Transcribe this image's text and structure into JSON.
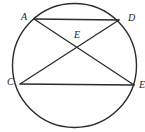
{
  "figure": {
    "kind": "circle-geometry-diagram",
    "canvas": {
      "width": 145,
      "height": 132,
      "background": "#ffffff"
    },
    "stroke_color": "#2b2b2b",
    "label_color": "#222222",
    "circle": {
      "cx": 74.5,
      "cy": 65.5,
      "r": 62,
      "stroke_width": 1.4
    },
    "points": [
      {
        "id": "A",
        "label": "A",
        "x": 34,
        "y": 19,
        "on_circle": true,
        "label_x": 21,
        "label_y": 12
      },
      {
        "id": "D",
        "label": "D",
        "x": 119,
        "y": 20,
        "on_circle": true,
        "label_x": 128,
        "label_y": 13
      },
      {
        "id": "C",
        "label": "C",
        "x": 20,
        "y": 84,
        "on_circle": true,
        "label_x": 7,
        "label_y": 77
      },
      {
        "id": "Eright",
        "label": "E",
        "x": 134,
        "y": 85,
        "on_circle": true,
        "label_x": 139,
        "label_y": 80
      },
      {
        "id": "Emid",
        "label": "E",
        "x": 77,
        "y": 46,
        "on_circle": false,
        "label_x": 74,
        "label_y": 30
      }
    ],
    "chords": [
      {
        "id": "AD",
        "from": "A",
        "to": "D",
        "x1": 34,
        "y1": 19,
        "x2": 119,
        "y2": 20
      },
      {
        "id": "CE",
        "from": "C",
        "to": "Eright",
        "x1": 20,
        "y1": 84,
        "x2": 134,
        "y2": 85
      },
      {
        "id": "AE",
        "from": "A",
        "to": "Eright",
        "x1": 34,
        "y1": 19,
        "x2": 134,
        "y2": 85
      },
      {
        "id": "CD",
        "from": "C",
        "to": "D",
        "x1": 20,
        "y1": 84,
        "x2": 119,
        "y2": 20
      }
    ],
    "intersection": {
      "id": "Emid",
      "x": 77,
      "y": 46,
      "of": "AE x CD"
    }
  }
}
